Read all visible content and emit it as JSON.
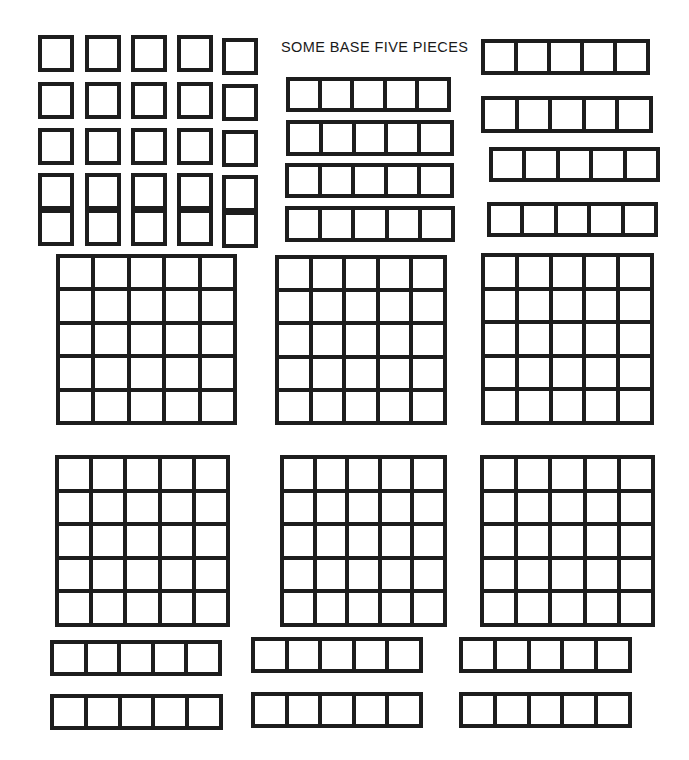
{
  "title": "SOME BASE FIVE PIECES",
  "title_pos": {
    "x": 281,
    "y": 39
  },
  "page": {
    "width": 689,
    "height": 760,
    "background": "#ffffff",
    "ink": "#1d1d1d"
  },
  "legend": {
    "unit_label": "unit (1)",
    "rod_label": "rod (5)",
    "flat_label": "flat (25)"
  },
  "counts": {
    "units": 25,
    "rods": 14,
    "flats": 6,
    "base": 5,
    "rod_cells": 5,
    "flat_rows": 5,
    "flat_cols": 5
  },
  "groups": [
    {
      "name": "unit-squares-block",
      "kind": "unit",
      "count": 25,
      "rows": 5,
      "cols": 5
    },
    {
      "name": "rods-top-middle",
      "kind": "rod",
      "count": 4
    },
    {
      "name": "rods-top-right",
      "kind": "rod",
      "count": 4
    },
    {
      "name": "flats-row-1",
      "kind": "flat",
      "count": 3
    },
    {
      "name": "flats-row-2",
      "kind": "flat",
      "count": 3
    },
    {
      "name": "rods-bottom",
      "kind": "rod",
      "count": 6
    }
  ],
  "units": [
    {
      "x": 38,
      "y": 35,
      "w": 36,
      "h": 37
    },
    {
      "x": 85,
      "y": 35,
      "w": 36,
      "h": 37
    },
    {
      "x": 131,
      "y": 35,
      "w": 36,
      "h": 37
    },
    {
      "x": 177,
      "y": 35,
      "w": 36,
      "h": 37
    },
    {
      "x": 222,
      "y": 38,
      "w": 36,
      "h": 37
    },
    {
      "x": 38,
      "y": 82,
      "w": 36,
      "h": 37
    },
    {
      "x": 85,
      "y": 82,
      "w": 36,
      "h": 37
    },
    {
      "x": 131,
      "y": 82,
      "w": 36,
      "h": 37
    },
    {
      "x": 177,
      "y": 82,
      "w": 36,
      "h": 37
    },
    {
      "x": 222,
      "y": 84,
      "w": 36,
      "h": 37
    },
    {
      "x": 38,
      "y": 128,
      "w": 36,
      "h": 37
    },
    {
      "x": 85,
      "y": 128,
      "w": 36,
      "h": 37
    },
    {
      "x": 131,
      "y": 128,
      "w": 36,
      "h": 37
    },
    {
      "x": 177,
      "y": 128,
      "w": 36,
      "h": 37
    },
    {
      "x": 222,
      "y": 130,
      "w": 36,
      "h": 37
    },
    {
      "x": 38,
      "y": 173,
      "w": 36,
      "h": 37
    },
    {
      "x": 85,
      "y": 173,
      "w": 36,
      "h": 37
    },
    {
      "x": 131,
      "y": 173,
      "w": 36,
      "h": 37
    },
    {
      "x": 177,
      "y": 173,
      "w": 36,
      "h": 37
    },
    {
      "x": 222,
      "y": 175,
      "w": 36,
      "h": 37
    },
    {
      "x": 38,
      "y": 209,
      "w": 36,
      "h": 37
    },
    {
      "x": 85,
      "y": 209,
      "w": 36,
      "h": 37
    },
    {
      "x": 131,
      "y": 209,
      "w": 36,
      "h": 37
    },
    {
      "x": 177,
      "y": 209,
      "w": 36,
      "h": 37
    },
    {
      "x": 222,
      "y": 211,
      "w": 36,
      "h": 37
    }
  ],
  "rods": [
    {
      "group": "rods-top-middle",
      "x": 286,
      "y": 77,
      "w": 165,
      "h": 35
    },
    {
      "group": "rods-top-middle",
      "x": 286,
      "y": 120,
      "w": 168,
      "h": 36
    },
    {
      "group": "rods-top-middle",
      "x": 285,
      "y": 163,
      "w": 169,
      "h": 35
    },
    {
      "group": "rods-top-middle",
      "x": 285,
      "y": 206,
      "w": 170,
      "h": 36
    },
    {
      "group": "rods-top-right",
      "x": 481,
      "y": 39,
      "w": 169,
      "h": 36
    },
    {
      "group": "rods-top-right",
      "x": 481,
      "y": 96,
      "w": 172,
      "h": 37
    },
    {
      "group": "rods-top-right",
      "x": 489,
      "y": 147,
      "w": 171,
      "h": 35
    },
    {
      "group": "rods-top-right",
      "x": 487,
      "y": 202,
      "w": 171,
      "h": 35
    },
    {
      "group": "rods-bottom",
      "x": 50,
      "y": 640,
      "w": 172,
      "h": 36
    },
    {
      "group": "rods-bottom",
      "x": 50,
      "y": 694,
      "w": 173,
      "h": 36
    },
    {
      "group": "rods-bottom",
      "x": 251,
      "y": 637,
      "w": 172,
      "h": 36
    },
    {
      "group": "rods-bottom",
      "x": 251,
      "y": 692,
      "w": 172,
      "h": 36
    },
    {
      "group": "rods-bottom",
      "x": 459,
      "y": 637,
      "w": 173,
      "h": 36
    },
    {
      "group": "rods-bottom",
      "x": 459,
      "y": 692,
      "w": 173,
      "h": 36
    }
  ],
  "flats": [
    {
      "group": "flats-row-1",
      "x": 56,
      "y": 254,
      "w": 181,
      "h": 171
    },
    {
      "group": "flats-row-1",
      "x": 275,
      "y": 255,
      "w": 172,
      "h": 170
    },
    {
      "group": "flats-row-1",
      "x": 481,
      "y": 253,
      "w": 173,
      "h": 172
    },
    {
      "group": "flats-row-2",
      "x": 55,
      "y": 455,
      "w": 175,
      "h": 172
    },
    {
      "group": "flats-row-2",
      "x": 280,
      "y": 455,
      "w": 167,
      "h": 172
    },
    {
      "group": "flats-row-2",
      "x": 480,
      "y": 455,
      "w": 175,
      "h": 172
    }
  ]
}
